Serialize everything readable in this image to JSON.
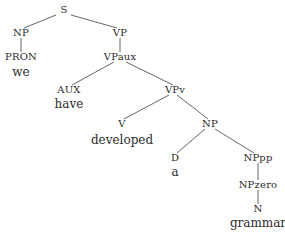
{
  "diagram": {
    "type": "syntax-tree",
    "nodes": [
      {
        "id": "S",
        "label": "S",
        "kind": "category",
        "x": 64,
        "y": 10
      },
      {
        "id": "NP1",
        "label": "NP",
        "kind": "category",
        "x": 21,
        "y": 33
      },
      {
        "id": "PRON",
        "label": "PRON",
        "kind": "category",
        "x": 21,
        "y": 57
      },
      {
        "id": "we",
        "label": "we",
        "kind": "word",
        "x": 21,
        "y": 72
      },
      {
        "id": "VP",
        "label": "VP",
        "kind": "category",
        "x": 120,
        "y": 33
      },
      {
        "id": "VPaux",
        "label": "VPaux",
        "kind": "category",
        "x": 120,
        "y": 57
      },
      {
        "id": "AUX",
        "label": "AUX",
        "kind": "category",
        "x": 69,
        "y": 90
      },
      {
        "id": "have",
        "label": "have",
        "kind": "word",
        "x": 69,
        "y": 104
      },
      {
        "id": "VPv",
        "label": "VPv",
        "kind": "category",
        "x": 175,
        "y": 90
      },
      {
        "id": "V",
        "label": "V",
        "kind": "category",
        "x": 122,
        "y": 124
      },
      {
        "id": "developed",
        "label": "developed",
        "kind": "word",
        "x": 122,
        "y": 140
      },
      {
        "id": "NP2",
        "label": "NP",
        "kind": "category",
        "x": 210,
        "y": 124
      },
      {
        "id": "D",
        "label": "D",
        "kind": "category",
        "x": 175,
        "y": 158
      },
      {
        "id": "a",
        "label": "a",
        "kind": "word",
        "x": 175,
        "y": 172
      },
      {
        "id": "NPpp",
        "label": "NPpp",
        "kind": "category",
        "x": 258,
        "y": 158
      },
      {
        "id": "NPzero",
        "label": "NPzero",
        "kind": "category",
        "x": 258,
        "y": 185
      },
      {
        "id": "N",
        "label": "N",
        "kind": "category",
        "x": 258,
        "y": 209
      },
      {
        "id": "grammar",
        "label": "grammar",
        "kind": "word",
        "x": 258,
        "y": 223
      }
    ],
    "edges": [
      {
        "from": "S",
        "to": "NP1",
        "x1": 56,
        "y1": 15,
        "x2": 24,
        "y2": 28
      },
      {
        "from": "S",
        "to": "VP",
        "x1": 71,
        "y1": 15,
        "x2": 117,
        "y2": 28
      },
      {
        "from": "NP1",
        "to": "PRON",
        "x1": 21,
        "y1": 38,
        "x2": 21,
        "y2": 52
      },
      {
        "from": "VP",
        "to": "VPaux",
        "x1": 120,
        "y1": 38,
        "x2": 120,
        "y2": 52
      },
      {
        "from": "VPaux",
        "to": "AUX",
        "x1": 114,
        "y1": 62,
        "x2": 72,
        "y2": 85
      },
      {
        "from": "VPaux",
        "to": "VPv",
        "x1": 126,
        "y1": 62,
        "x2": 173,
        "y2": 85
      },
      {
        "from": "VPv",
        "to": "V",
        "x1": 169,
        "y1": 95,
        "x2": 124,
        "y2": 119
      },
      {
        "from": "VPv",
        "to": "NP2",
        "x1": 177,
        "y1": 95,
        "x2": 208,
        "y2": 119
      },
      {
        "from": "NP2",
        "to": "D",
        "x1": 205,
        "y1": 129,
        "x2": 177,
        "y2": 153
      },
      {
        "from": "NP2",
        "to": "NPpp",
        "x1": 215,
        "y1": 129,
        "x2": 254,
        "y2": 153
      },
      {
        "from": "NPpp",
        "to": "NPzero",
        "x1": 258,
        "y1": 163,
        "x2": 258,
        "y2": 180
      },
      {
        "from": "NPzero",
        "to": "N",
        "x1": 258,
        "y1": 190,
        "x2": 258,
        "y2": 204
      }
    ]
  }
}
